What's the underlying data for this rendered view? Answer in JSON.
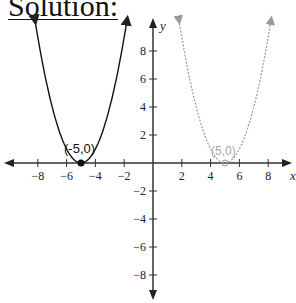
{
  "heading": "Solution:",
  "chart_data": {
    "type": "line",
    "title": "",
    "xlabel": "x",
    "ylabel": "y",
    "xlim": [
      -10,
      10
    ],
    "ylim": [
      -10,
      10
    ],
    "x_ticks": [
      -8,
      -6,
      -4,
      -2,
      2,
      4,
      6,
      8
    ],
    "y_ticks": [
      8,
      6,
      4,
      2,
      -2,
      -4,
      -6,
      -8
    ],
    "grid": false,
    "series": [
      {
        "name": "y = (x+5)^2",
        "style": "solid",
        "color": "#111111",
        "vertex": [
          -5,
          0
        ],
        "vertex_label": "(-5,0)"
      },
      {
        "name": "y = (x-5)^2",
        "style": "dotted",
        "color": "#9a9a9a",
        "vertex": [
          5,
          0
        ],
        "vertex_label": "(5,0)"
      }
    ]
  }
}
